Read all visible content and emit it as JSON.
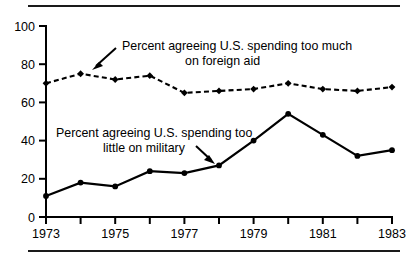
{
  "figure": {
    "top_rule": "horizontal-rule",
    "bottom_rule": "horizontal-rule"
  },
  "annotations": {
    "foreign_aid": {
      "line1": "Percent agreeing U.S. spending too much",
      "line2": "on foreign aid"
    },
    "military": {
      "line1": "Percent agreeing U.S. spending too",
      "line2": "little on military"
    }
  },
  "axis": {
    "y_ticks": [
      "0",
      "20",
      "40",
      "60",
      "80",
      "100"
    ],
    "x_ticks": [
      "1973",
      "1975",
      "1977",
      "1979",
      "1981",
      "1983"
    ]
  },
  "chart_data": {
    "type": "line",
    "title": "",
    "xlabel": "",
    "ylabel": "",
    "xlim": [
      1973,
      1983
    ],
    "ylim": [
      0,
      100
    ],
    "grid": false,
    "legend_position": "inline-annotations",
    "x": [
      1973,
      1974,
      1975,
      1976,
      1977,
      1978,
      1979,
      1980,
      1981,
      1982,
      1983
    ],
    "x_tick_labels": [
      "1973",
      "",
      "1975",
      "",
      "1977",
      "",
      "1979",
      "",
      "1981",
      "",
      "1983"
    ],
    "y_ticks": [
      0,
      20,
      40,
      60,
      80,
      100
    ],
    "series": [
      {
        "name": "Percent agreeing U.S. spending too much on foreign aid",
        "style": "dashed",
        "marker": "diamond",
        "color": "#000000",
        "values": [
          70,
          75,
          72,
          74,
          65,
          66,
          67,
          70,
          67,
          66,
          68
        ]
      },
      {
        "name": "Percent agreeing U.S. spending too little on military",
        "style": "solid",
        "marker": "circle",
        "color": "#000000",
        "values": [
          11,
          18,
          16,
          24,
          23,
          27,
          40,
          54,
          43,
          32,
          35
        ]
      }
    ]
  }
}
